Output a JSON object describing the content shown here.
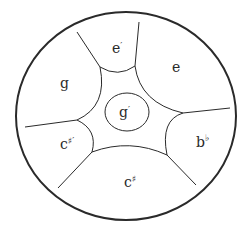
{
  "diagram": {
    "type": "steelpan-note-layout",
    "colors": {
      "stroke": "#2a2a2a",
      "background": "#ffffff"
    },
    "notes": [
      {
        "id": "e-prime",
        "base": "e",
        "mark": "′",
        "position": "top"
      },
      {
        "id": "e",
        "base": "e",
        "mark": "",
        "position": "upper-right"
      },
      {
        "id": "g",
        "base": "g",
        "mark": "",
        "position": "upper-left"
      },
      {
        "id": "g-prime",
        "base": "g",
        "mark": "′",
        "position": "center"
      },
      {
        "id": "c-sharp-prime",
        "base": "c",
        "mark": "♯′",
        "position": "lower-left"
      },
      {
        "id": "b-flat",
        "base": "b",
        "mark": "♭",
        "position": "lower-right"
      },
      {
        "id": "c-sharp",
        "base": "c",
        "mark": "♯",
        "position": "bottom"
      }
    ]
  }
}
